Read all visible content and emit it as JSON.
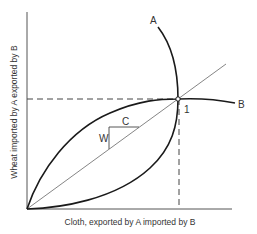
{
  "diagram": {
    "type": "offer-curves",
    "x_axis_label": "Cloth, exported by A imported by B",
    "y_axis_label": "Wheat imported by A exported by B",
    "curve_a_label": "A",
    "curve_b_label": "B",
    "equilibrium_label": "1",
    "triangle_horizontal_label": "C",
    "triangle_vertical_label": "W",
    "colors": {
      "curve": "#1a1a1a",
      "axis": "#555555",
      "guide": "#444444",
      "text": "#333333"
    }
  }
}
